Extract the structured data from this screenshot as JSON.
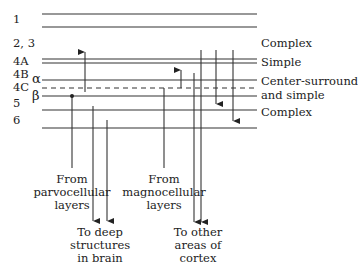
{
  "diagram": {
    "layer_labels": [
      "1",
      "2, 3",
      "4A",
      "4B",
      "4C",
      "5",
      "6"
    ],
    "sublayer_labels": {
      "alpha": "α",
      "beta": "β"
    },
    "cell_type_labels": {
      "layer_2_3": "Complex",
      "layer_4A": "Simple",
      "layer_4C_line1": "Center-surround",
      "layer_4C_line2": "and simple",
      "layer_5": "Complex"
    },
    "inputs": {
      "parvo": [
        "From",
        "parvocellular",
        "layers"
      ],
      "magno": [
        "From",
        "magnocellular",
        "layers"
      ]
    },
    "outputs": {
      "deep": [
        "To deep",
        "structures",
        "in brain"
      ],
      "cortex": [
        "To other",
        "areas of",
        "cortex"
      ]
    }
  }
}
